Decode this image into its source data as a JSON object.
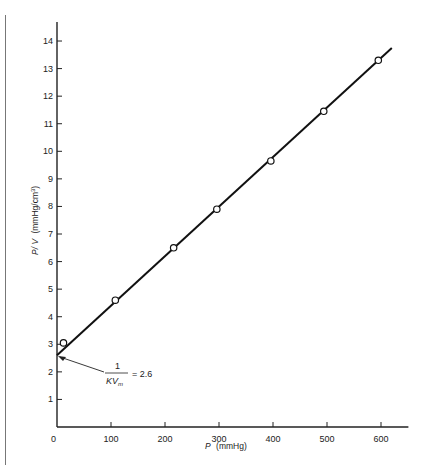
{
  "chart_data": {
    "type": "scatter",
    "title": "",
    "xlabel": "P (mmHg)",
    "xlabel_italic": "P",
    "xlabel_unit": "(mmHg)",
    "ylabel": "P/V (mmHg/cm³)",
    "ylabel_italic": "P/ V",
    "ylabel_unit": "(mmHg/cm",
    "ylabel_sup": "3",
    "ylabel_close": ")",
    "xlim": [
      0,
      660
    ],
    "ylim": [
      0,
      14.8
    ],
    "x_ticks": [
      0,
      100,
      200,
      300,
      400,
      500,
      600
    ],
    "y_ticks": [
      1,
      2,
      3,
      4,
      5,
      6,
      7,
      8,
      9,
      10,
      11,
      12,
      13,
      14
    ],
    "grid": false,
    "legend": null,
    "series": [
      {
        "name": "measured",
        "marker": "open-circle",
        "x": [
          12,
          108,
          216,
          296,
          396,
          494,
          595
        ],
        "y": [
          3.05,
          4.6,
          6.5,
          7.9,
          9.65,
          11.45,
          13.3
        ]
      },
      {
        "name": "linear fit",
        "type": "line",
        "x": [
          0,
          620
        ],
        "y": [
          2.6,
          13.75
        ]
      }
    ],
    "annotations": [
      {
        "text_numerator": "1",
        "text_denominator": "KV",
        "text_denominator_sub": "m",
        "text_value": "= 2.6",
        "points_to": {
          "x": 0,
          "y": 2.6
        }
      }
    ]
  },
  "labels": {
    "zero": "0"
  }
}
